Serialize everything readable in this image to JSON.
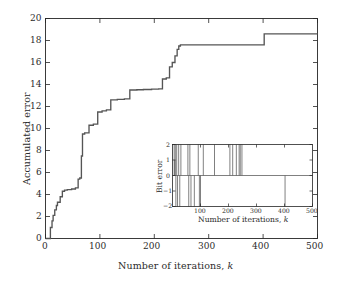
{
  "figure": {
    "background_color": "#ffffff",
    "line_color": "#555555",
    "axis_color": "#262626",
    "font_note": "serif"
  },
  "main_axes": {
    "x_title_prefix": "Number of iterations, ",
    "x_title_italic": "k",
    "y_title": "Accumulated error",
    "x_ticks": [
      "0",
      "100",
      "200",
      "300",
      "400",
      "500"
    ],
    "y_ticks": [
      "0",
      "2",
      "4",
      "6",
      "8",
      "10",
      "12",
      "14",
      "16",
      "18",
      "20"
    ]
  },
  "inset_axes": {
    "x_title_prefix": "Number of iterations, ",
    "x_title_italic": "k",
    "y_title": "Bit error",
    "x_ticks": [
      "100",
      "200",
      "300",
      "400",
      "500"
    ],
    "y_ticks": [
      "2",
      "1",
      "0",
      "−1",
      "−2"
    ]
  },
  "chart_data": [
    {
      "type": "line",
      "name": "accumulated-error-staircase",
      "title": "",
      "xlabel": "Number of iterations, k",
      "ylabel": "Accumulated error",
      "xlim": [
        0,
        500
      ],
      "ylim": [
        0,
        20
      ],
      "xticks": [
        0,
        100,
        200,
        300,
        400,
        500
      ],
      "yticks": [
        0,
        2,
        4,
        6,
        8,
        10,
        12,
        14,
        16,
        18,
        20
      ],
      "grid": false,
      "legend": "none",
      "step_style": "post",
      "x": [
        0,
        8,
        9,
        12,
        14,
        17,
        20,
        22,
        27,
        31,
        35,
        40,
        48,
        55,
        60,
        63,
        66,
        68,
        72,
        80,
        88,
        96,
        104,
        112,
        120,
        132,
        145,
        155,
        168,
        180,
        195,
        208,
        215,
        222,
        228,
        233,
        238,
        242,
        245,
        248,
        300,
        350,
        398,
        402,
        450,
        500
      ],
      "y": [
        0,
        0,
        1.0,
        1.6,
        2.1,
        2.6,
        3.0,
        3.3,
        3.8,
        4.3,
        4.4,
        4.45,
        4.5,
        4.6,
        5.4,
        5.5,
        7.5,
        9.5,
        9.6,
        10.3,
        10.4,
        11.5,
        11.6,
        11.7,
        12.6,
        12.65,
        12.7,
        13.5,
        13.52,
        13.55,
        13.58,
        13.6,
        14.5,
        14.6,
        15.6,
        16.0,
        16.6,
        17.2,
        17.5,
        17.6,
        17.6,
        17.6,
        17.6,
        18.6,
        18.6,
        18.6
      ]
    },
    {
      "type": "line",
      "name": "bit-error-inset",
      "title": "",
      "xlabel": "Number of iterations, k",
      "ylabel": "Bit error",
      "xlim": [
        0,
        500
      ],
      "ylim": [
        -2,
        2
      ],
      "xticks": [
        100,
        200,
        300,
        400,
        500
      ],
      "yticks": [
        -2,
        -1,
        0,
        1,
        2
      ],
      "grid": false,
      "legend": "none",
      "description": "Sparse impulse train of bit errors; value is 0 except at spike indices where it reaches +2 or -2.",
      "spikes": [
        {
          "x": 6,
          "value": 2
        },
        {
          "x": 8,
          "value": 1
        },
        {
          "x": 10,
          "value": 2
        },
        {
          "x": 12,
          "value": -2
        },
        {
          "x": 15,
          "value": 2
        },
        {
          "x": 18,
          "value": -2
        },
        {
          "x": 22,
          "value": 2
        },
        {
          "x": 26,
          "value": -2
        },
        {
          "x": 30,
          "value": 2
        },
        {
          "x": 55,
          "value": 2
        },
        {
          "x": 58,
          "value": -2
        },
        {
          "x": 62,
          "value": 2
        },
        {
          "x": 66,
          "value": -2
        },
        {
          "x": 78,
          "value": -2
        },
        {
          "x": 92,
          "value": 2
        },
        {
          "x": 96,
          "value": -2
        },
        {
          "x": 100,
          "value": -2
        },
        {
          "x": 110,
          "value": 2
        },
        {
          "x": 150,
          "value": 2
        },
        {
          "x": 205,
          "value": 2
        },
        {
          "x": 215,
          "value": 2
        },
        {
          "x": 228,
          "value": 2
        },
        {
          "x": 238,
          "value": 2
        },
        {
          "x": 242,
          "value": 2
        },
        {
          "x": 248,
          "value": 2
        },
        {
          "x": 402,
          "value": -2
        }
      ]
    }
  ]
}
